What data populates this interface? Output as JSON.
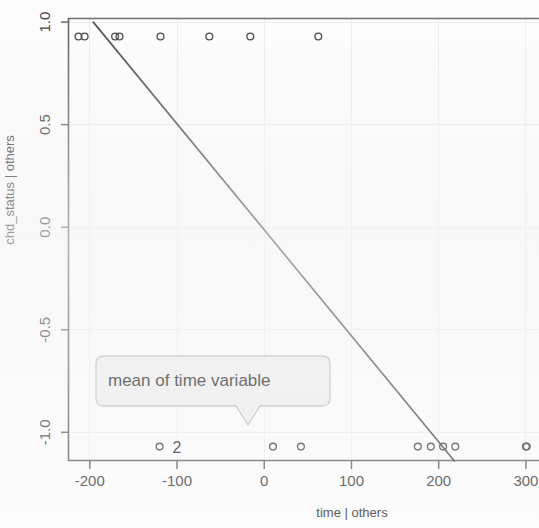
{
  "chart_data": {
    "type": "scatter",
    "title": "",
    "xlabel": "time | others",
    "ylabel": "chd_status | others",
    "xlim": [
      -225,
      315
    ],
    "ylim": [
      -1.14,
      1.02
    ],
    "xticks": [
      -200,
      -100,
      0,
      100,
      200,
      300
    ],
    "xtick_labels": [
      "-200",
      "-100",
      "0",
      "100",
      "200",
      "300"
    ],
    "yticks": [
      -1.0,
      -0.5,
      0.0,
      0.5,
      1.0
    ],
    "ytick_labels": [
      "-1.0",
      "-0.5",
      "0.0",
      "0.5",
      "1.0"
    ],
    "grid": true,
    "legend": null,
    "marker": "open-circle",
    "series": [
      {
        "name": "partial residuals",
        "x": [
          -213,
          -206,
          -171,
          -166,
          -119,
          -63,
          -16,
          62,
          -120,
          10,
          42,
          176,
          191,
          205,
          219,
          300,
          301
        ],
        "y": [
          0.93,
          0.93,
          0.93,
          0.93,
          0.93,
          0.93,
          0.93,
          0.93,
          -1.07,
          -1.07,
          -1.07,
          -1.07,
          -1.07,
          -1.07,
          -1.07,
          -1.07,
          -1.07
        ]
      }
    ],
    "fit_line": {
      "name": "partial regression line",
      "x0": -196,
      "y0": 1.0,
      "x1": 218,
      "y1": -1.14,
      "slope": -0.00517,
      "color": "#4a4a4a"
    },
    "annotations": [
      {
        "name": "mean-of-time-callout",
        "text": "mean of time variable",
        "x": -100,
        "y": -0.78,
        "shape": "rounded-speech-balloon",
        "tail": "down"
      },
      {
        "name": "point-count-label",
        "text": "2",
        "x": -112,
        "y": -1.07
      }
    ],
    "colors": {
      "axis": "#4b4b4b",
      "marker_stroke": "#3f3f3f",
      "grid": "#e9e9e9",
      "fit_line": "#4a4a4a",
      "callout_fill": "#eeeeee",
      "callout_stroke": "#bdbdbd",
      "text": "#2e2e2e",
      "background": "#fcfcfc"
    }
  },
  "axes": {
    "x_title": "time | others",
    "y_title": "chd_status | others"
  }
}
